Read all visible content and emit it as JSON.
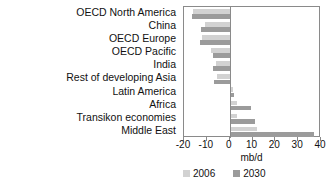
{
  "chart_data": {
    "type": "bar",
    "orientation": "horizontal",
    "title": "",
    "xlabel": "mb/d",
    "ylabel": "",
    "xlim": [
      -20,
      40
    ],
    "xticks": [
      -20,
      -10,
      0,
      10,
      20,
      30,
      40
    ],
    "xticklabels": [
      "-20",
      "-10",
      "0",
      "10",
      "20",
      "30",
      "40"
    ],
    "grid": false,
    "legend_position": "bottom",
    "categories": [
      "OECD North America",
      "China",
      "OECD Europe",
      "OECD Pacific",
      "India",
      "Rest of developing Asia",
      "Latin America",
      "Africa",
      "Transikon economies",
      "Middle East"
    ],
    "series": [
      {
        "name": "2006",
        "color": "#d2d2d2",
        "values": [
          -16.0,
          -11.0,
          -12.0,
          -8.0,
          -6.0,
          -5.5,
          1.5,
          3.0,
          3.0,
          12.0
        ]
      },
      {
        "name": "2030",
        "color": "#9b9b9b",
        "values": [
          -16.5,
          -12.5,
          -13.0,
          -7.5,
          -7.5,
          -7.0,
          2.0,
          9.5,
          11.0,
          37.0
        ]
      }
    ]
  },
  "legend": {
    "items": [
      {
        "label": "2006"
      },
      {
        "label": "2030"
      }
    ]
  },
  "colors": {
    "series_2006": "#d2d2d2",
    "series_2030": "#9b9b9b",
    "frame": "#8a8a8a",
    "text": "#111111",
    "background": "#ffffff"
  }
}
